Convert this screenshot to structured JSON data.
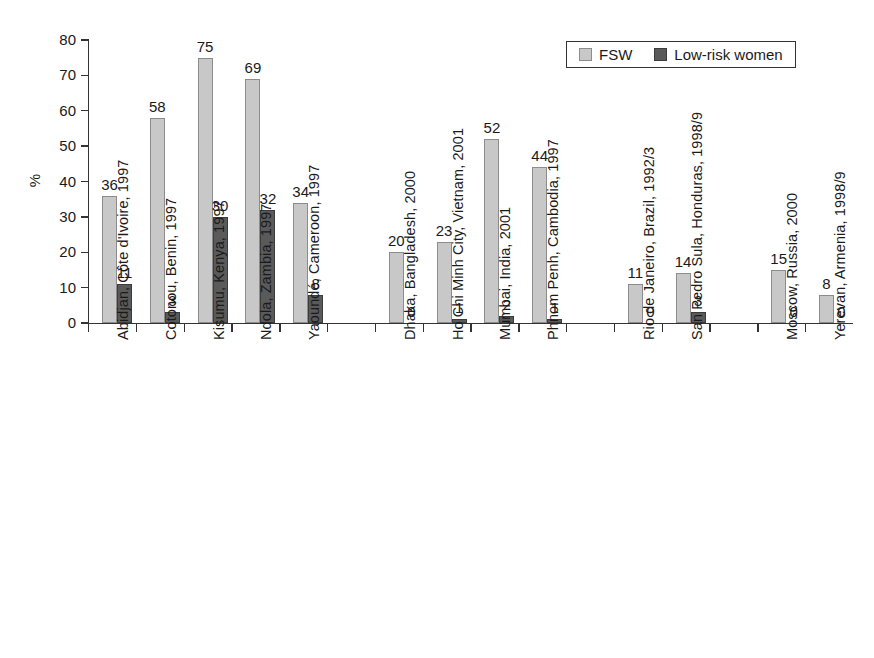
{
  "chart_data": {
    "type": "bar",
    "title": "",
    "subtitle": "",
    "xlabel": "",
    "ylabel": "%",
    "ylim": [
      0,
      80
    ],
    "yticks": [
      0,
      10,
      20,
      30,
      40,
      50,
      60,
      70,
      80
    ],
    "grid": false,
    "legend_position": "top-right",
    "categories": [
      "Abidjan, Côte d'Ivoire, 1997",
      "Cotonou, Benin, 1997",
      "Kisumu, Kenya, 1997",
      "Ndola, Zambia, 1997",
      "Yaoundé, Cameroon, 1997",
      "Dhaka, Bangladesh, 2000",
      "Ho Chi Minh City, Vietnam, 2001",
      "Mumbai, India, 2001",
      "Phnom Penh, Cambodia, 1997",
      "Rio de Janeiro, Brazil, 1992/3",
      "San Pedro Sula, Honduras, 1998/9",
      "Moscow, Russia, 2000",
      "Yerevan, Armenia, 1998/9"
    ],
    "slots": [
      0,
      1,
      2,
      3,
      4,
      6,
      7,
      8,
      9,
      11,
      12,
      14,
      15
    ],
    "series": [
      {
        "name": "FSW",
        "color": "#c8c8c8",
        "values": [
          36,
          58,
          75,
          69,
          34,
          20,
          23,
          52,
          44,
          11,
          14,
          15,
          8
        ]
      },
      {
        "name": "Low-risk women",
        "color": "#5a5a5a",
        "values": [
          11,
          3,
          30,
          32,
          8,
          0,
          1,
          2,
          1,
          0,
          3,
          0,
          0
        ]
      }
    ]
  },
  "axis": {
    "y_title": "%",
    "y_tick_labels": [
      "0",
      "10",
      "20",
      "30",
      "40",
      "50",
      "60",
      "70",
      "80"
    ]
  },
  "legend": {
    "entries": [
      {
        "label": "FSW",
        "swatch": "fsw"
      },
      {
        "label": "Low-risk women",
        "swatch": "lrw"
      }
    ]
  }
}
